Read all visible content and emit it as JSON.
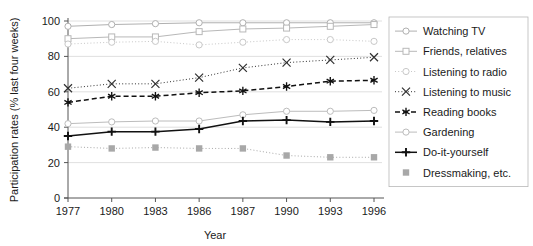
{
  "chart_data": {
    "type": "line",
    "title": "",
    "xlabel": "Year",
    "ylabel": "Participation rates (% last four weeks)",
    "categories": [
      "1977",
      "1980",
      "1983",
      "1986",
      "1987",
      "1990",
      "1993",
      "1996"
    ],
    "x": [
      1977,
      1980,
      1983,
      1986,
      1987,
      1990,
      1993,
      1996
    ],
    "ylim": [
      0,
      100
    ],
    "yticks": [
      0,
      20,
      40,
      60,
      80,
      100
    ],
    "ytick_labels": [
      "0",
      "20",
      "40",
      "60",
      "80",
      "100"
    ],
    "grid": true,
    "legend_position": "right",
    "series": [
      {
        "name": "Watching TV",
        "values": [
          97,
          98,
          98.5,
          99,
          99,
          99,
          99,
          99
        ],
        "color": "#b0b0b0",
        "marker": "circle-open",
        "dash": "solid"
      },
      {
        "name": "Friends, relatives",
        "values": [
          90,
          91,
          91,
          94,
          95.5,
          96,
          97,
          98
        ],
        "color": "#b8b8b8",
        "marker": "square-open",
        "dash": "solid"
      },
      {
        "name": "Listening to radio",
        "values": [
          87,
          88,
          88.5,
          86.5,
          88,
          89.5,
          89.5,
          88.5
        ],
        "color": "#c8c8c8",
        "marker": "circle-open",
        "dash": "dotted"
      },
      {
        "name": "Listening to music",
        "values": [
          62,
          64.5,
          64.5,
          68,
          73.5,
          76.5,
          78,
          79.5
        ],
        "color": "#303030",
        "marker": "x-cross",
        "dash": "dotted"
      },
      {
        "name": "Reading books",
        "values": [
          54,
          57.5,
          57.5,
          59.5,
          60.5,
          63,
          66,
          66.5
        ],
        "color": "#111111",
        "marker": "asterisk",
        "dash": "dashed"
      },
      {
        "name": "Gardening",
        "values": [
          42,
          43,
          43.5,
          43.5,
          47,
          49,
          49,
          49.5
        ],
        "color": "#bcbcbc",
        "marker": "circle-open",
        "dash": "solid"
      },
      {
        "name": "Do-it-yourself",
        "values": [
          35,
          37.5,
          37.5,
          39,
          43.5,
          44,
          43,
          43.5
        ],
        "color": "#111111",
        "marker": "plus",
        "dash": "solid"
      },
      {
        "name": "Dressmaking, etc.",
        "values": [
          29,
          28,
          28.5,
          28,
          28,
          24,
          23,
          23
        ],
        "color": "#a8a8a8",
        "marker": "square-filled",
        "dash": "dotted"
      }
    ]
  },
  "legend": {
    "items": [
      {
        "label": "Watching TV"
      },
      {
        "label": "Friends, relatives"
      },
      {
        "label": "Listening to radio"
      },
      {
        "label": "Listening to music"
      },
      {
        "label": "Reading books"
      },
      {
        "label": "Gardening"
      },
      {
        "label": "Do-it-yourself"
      },
      {
        "label": "Dressmaking, etc."
      }
    ]
  },
  "axes": {
    "y_title": "Participation rates (% last four weeks)",
    "x_title": "Year",
    "y_ticks": [
      "100",
      "80",
      "60",
      "40",
      "20",
      "0"
    ],
    "x_ticks": [
      "1977",
      "1980",
      "1983",
      "1986",
      "1987",
      "1990",
      "1993",
      "1996"
    ]
  }
}
